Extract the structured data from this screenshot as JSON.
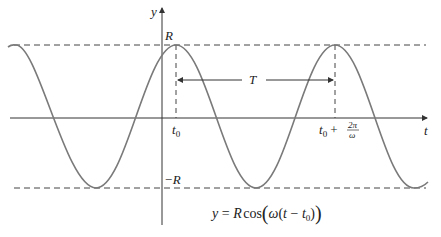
{
  "diagram": {
    "type": "cosine-wave",
    "equation": {
      "lhs": "y",
      "eq": "=",
      "R": "R",
      "func": "cos",
      "omega": "ω",
      "open_paren": "(",
      "t": "t",
      "minus": "−",
      "t0_base": "t",
      "t0_sub": "0",
      "close_paren": ")"
    },
    "axes": {
      "x_label": "t",
      "y_label": "y"
    },
    "levels": {
      "top": "R",
      "bottom": "−R"
    },
    "ticks": {
      "t0_base": "t",
      "t0_sub": "0",
      "t0p_base": "t",
      "t0p_sub": "0",
      "t0p_plus": "+",
      "frac_num": "2π",
      "frac_den": "ω"
    },
    "period_label": "T",
    "colors": {
      "curve": "#7a7a7a",
      "axes": "#333333",
      "dashed": "#444444"
    }
  }
}
